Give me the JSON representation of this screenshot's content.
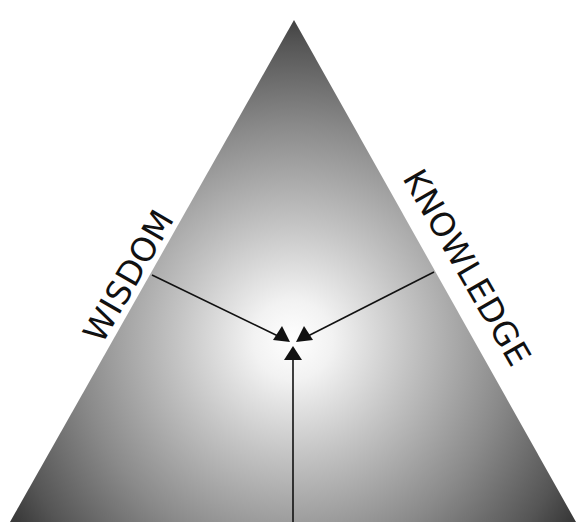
{
  "diagram": {
    "type": "triangle-convergence",
    "labels": {
      "left_side": "WISDOM",
      "right_side": "KNOWLEDGE"
    },
    "shape": {
      "apex": [
        294,
        20
      ],
      "base_left": [
        10,
        522
      ],
      "base_right": [
        576,
        522
      ]
    },
    "center_point": [
      293,
      345
    ],
    "arrows": [
      {
        "from": [
          152,
          275
        ],
        "to": [
          284,
          340
        ],
        "direction": "into-center-from-left"
      },
      {
        "from": [
          434,
          272
        ],
        "to": [
          302,
          340
        ],
        "direction": "into-center-from-right"
      },
      {
        "from": [
          293,
          522
        ],
        "to": [
          293,
          352
        ],
        "direction": "into-center-from-base"
      }
    ],
    "colors": {
      "center_glow": "#ffffff",
      "edge_dark": "#3a3a3a",
      "line": "#111111",
      "background": "#ffffff"
    }
  }
}
